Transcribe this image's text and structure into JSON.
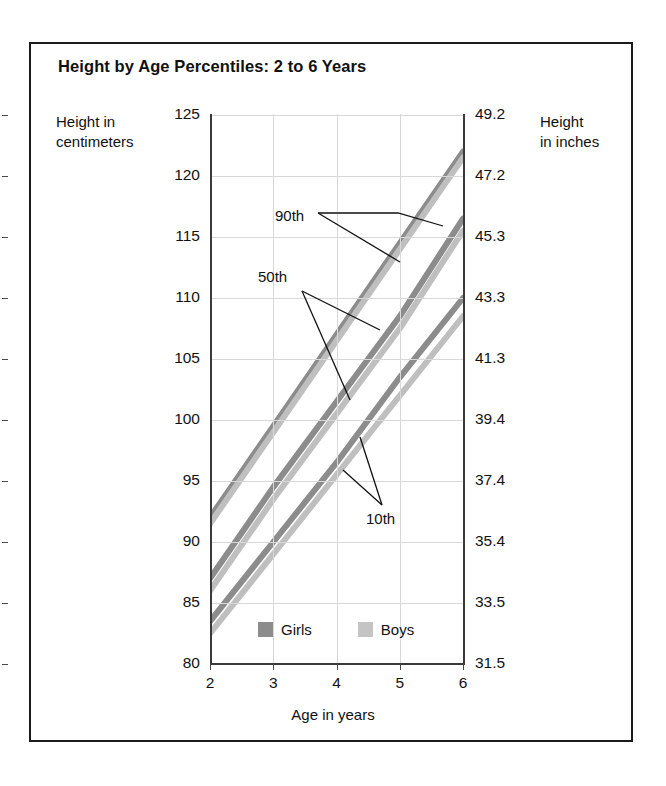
{
  "chart_data": {
    "type": "line",
    "title": "Height by Age Percentiles: 2 to 6 Years",
    "xlabel": "Age in years",
    "ylabel": "Height in centimeters",
    "ylabel_secondary": "Height in inches",
    "xlim": [
      2,
      6
    ],
    "ylim": [
      80,
      125
    ],
    "ylim_secondary": [
      31.5,
      49.2
    ],
    "grid": true,
    "legend_position": "bottom-inside",
    "xticks": [
      "2",
      "3",
      "4",
      "5",
      "6"
    ],
    "yticks": [
      "80",
      "85",
      "90",
      "95",
      "100",
      "105",
      "110",
      "115",
      "120",
      "125"
    ],
    "yticks_secondary": [
      "31.5",
      "33.5",
      "35.4",
      "37.4",
      "39.4",
      "41.3",
      "43.3",
      "45.3",
      "47.2",
      "49.2"
    ],
    "x": [
      2,
      3,
      4,
      5,
      6
    ],
    "series": [
      {
        "name": "Girls 90th",
        "group": "Girls",
        "percentile": "90th",
        "color": "#8c8c8c",
        "values": [
          92.0,
          99.5,
          107.0,
          114.5,
          122.0
        ]
      },
      {
        "name": "Boys 90th",
        "group": "Boys",
        "percentile": "90th",
        "color": "#bfbfbf",
        "values": [
          91.5,
          99.0,
          106.5,
          114.0,
          121.5
        ]
      },
      {
        "name": "Girls 50th",
        "group": "Girls",
        "percentile": "50th",
        "color": "#8c8c8c",
        "values": [
          87.0,
          94.5,
          101.5,
          108.5,
          116.5
        ]
      },
      {
        "name": "Boys 50th",
        "group": "Boys",
        "percentile": "50th",
        "color": "#bfbfbf",
        "values": [
          86.0,
          93.5,
          100.5,
          107.5,
          115.5
        ]
      },
      {
        "name": "Girls 10th",
        "group": "Girls",
        "percentile": "10th",
        "color": "#8c8c8c",
        "values": [
          83.5,
          90.0,
          96.5,
          103.5,
          110.0
        ]
      },
      {
        "name": "Boys 10th",
        "group": "Boys",
        "percentile": "10th",
        "color": "#bfbfbf",
        "values": [
          82.5,
          89.0,
          95.5,
          102.0,
          108.5
        ]
      }
    ],
    "annotations": [
      {
        "label": "90th",
        "x": 275,
        "y": 207
      },
      {
        "label": "50th",
        "x": 258,
        "y": 268
      },
      {
        "label": "10th",
        "x": 366,
        "y": 510
      }
    ],
    "legend": [
      {
        "label": "Girls",
        "color": "#8c8c8c"
      },
      {
        "label": "Boys",
        "color": "#c4c4c4"
      }
    ]
  }
}
